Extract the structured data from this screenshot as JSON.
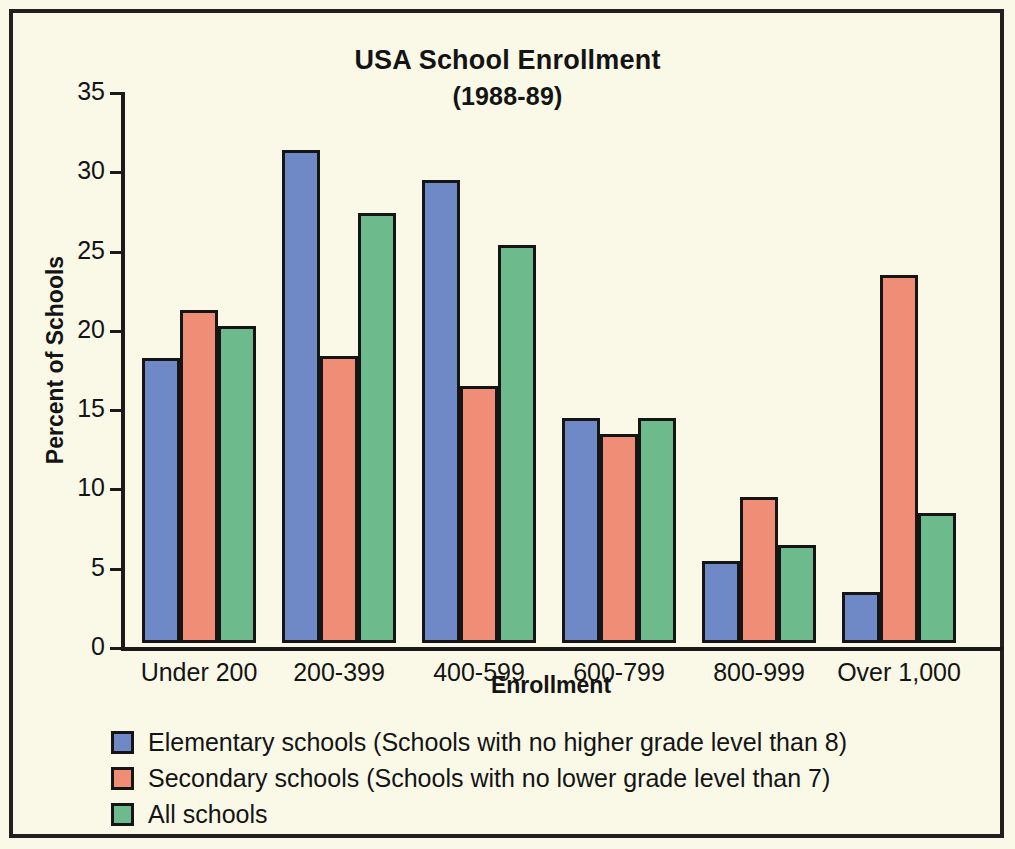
{
  "chart_data": {
    "type": "bar",
    "title": "USA School Enrollment",
    "subtitle": "(1988-89)",
    "xlabel": "Enrollment",
    "ylabel": "Percent of Schools",
    "categories": [
      "Under 200",
      "200-399",
      "400-599",
      "600-799",
      "800-999",
      "Over 1,000"
    ],
    "series": [
      {
        "name": "Elementary schools (Schools with no higher grade level than 8)",
        "color": "#6f88c6",
        "values": [
          18.0,
          31.1,
          29.2,
          14.2,
          5.2,
          3.2
        ]
      },
      {
        "name": "Secondary schools (Schools with no lower grade level than 7)",
        "color": "#ef8d76",
        "values": [
          21.0,
          18.1,
          16.2,
          13.2,
          9.2,
          23.2
        ]
      },
      {
        "name": "All schools",
        "color": "#6dba8d",
        "values": [
          20.0,
          27.1,
          25.1,
          14.2,
          6.2,
          8.2
        ]
      }
    ],
    "ylim": [
      0,
      35
    ],
    "yticks": [
      0,
      5,
      10,
      15,
      20,
      25,
      30,
      35
    ],
    "ytick_labels": [
      "0",
      "5",
      "10",
      "15",
      "20",
      "25",
      "30",
      "35"
    ],
    "grid": false,
    "legend_position": "below-plot-left",
    "background_color": "#faf9e8",
    "frame_color": "#231f20"
  }
}
